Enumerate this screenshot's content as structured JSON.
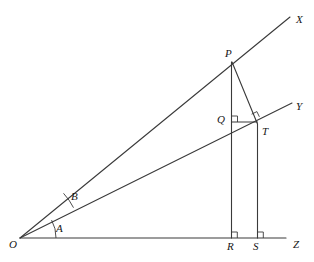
{
  "figure": {
    "type": "geometry-diagram",
    "background_color": "#ffffff",
    "stroke_color": "#3a3a3a",
    "label_color": "#161616"
  },
  "points": [
    {
      "id": "O",
      "label": "O",
      "x": 20,
      "y": 238,
      "label_x": 9,
      "label_y": 239
    },
    {
      "id": "X",
      "label": "X",
      "x": 290,
      "y": 17,
      "label_x": 296,
      "label_y": 14
    },
    {
      "id": "Y",
      "label": "Y",
      "x": 292,
      "y": 103,
      "label_x": 296,
      "label_y": 101
    },
    {
      "id": "Z",
      "label": "Z",
      "x": 286,
      "y": 238,
      "label_x": 293,
      "label_y": 239
    },
    {
      "id": "P",
      "label": "P",
      "x": 232,
      "y": 62,
      "label_x": 225,
      "label_y": 48
    },
    {
      "id": "Q",
      "label": "Q",
      "x": 231,
      "y": 122,
      "label_x": 217,
      "label_y": 114
    },
    {
      "id": "T",
      "label": "T",
      "x": 257,
      "y": 124,
      "label_x": 262,
      "label_y": 126
    },
    {
      "id": "R",
      "label": "R",
      "x": 231,
      "y": 238,
      "label_x": 227,
      "label_y": 241
    },
    {
      "id": "S",
      "label": "S",
      "x": 257,
      "y": 238,
      "label_x": 253,
      "label_y": 241
    }
  ],
  "angles": [
    {
      "id": "A",
      "label": "A",
      "vertex": "O",
      "between": [
        "OZ",
        "OY"
      ],
      "arc_radius": 36,
      "label_x": 56,
      "label_y": 223
    },
    {
      "id": "B",
      "label": "B",
      "vertex": "O",
      "between": [
        "OY",
        "OX"
      ],
      "arc_radius": 61,
      "label_x": 71,
      "label_y": 191
    }
  ],
  "segments": [
    {
      "id": "OX",
      "from": "O",
      "to": "X"
    },
    {
      "id": "OY",
      "from": "O",
      "to": "Y"
    },
    {
      "id": "OZ",
      "from": "O",
      "to": "Z"
    },
    {
      "id": "PR",
      "from": "P",
      "to": "R"
    },
    {
      "id": "TS",
      "from": "T",
      "to": "S"
    },
    {
      "id": "PT",
      "from": "P",
      "to": "T"
    },
    {
      "id": "QT",
      "from": "Q",
      "to": "T"
    }
  ],
  "right_angles": [
    {
      "id": "at-Q",
      "at": "Q",
      "between": [
        "QP",
        "QT"
      ]
    },
    {
      "id": "at-T",
      "at": "T",
      "between": [
        "TP",
        "TY"
      ]
    },
    {
      "id": "at-R",
      "at": "R",
      "between": [
        "RP",
        "RZ"
      ]
    },
    {
      "id": "at-S",
      "at": "S",
      "between": [
        "ST",
        "SZ"
      ]
    }
  ]
}
